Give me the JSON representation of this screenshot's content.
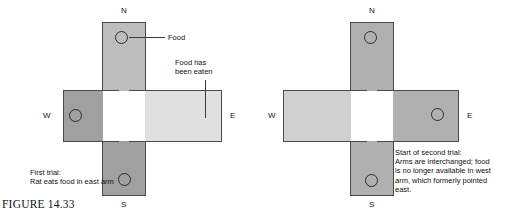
{
  "figure": {
    "caption": "FIGURE 14.33"
  },
  "colors": {
    "arm_medium_light": "#bdbdbd",
    "arm_dark": "#a0a0a0",
    "arm_very_light": "#e0e0e0",
    "arm_light": "#d0d0d0",
    "arm_medium": "#b0b0b0",
    "center_white": "#ffffff",
    "outline": "#4a4a4a",
    "text": "#111111"
  },
  "panels": [
    {
      "id": "first-trial",
      "compass": {
        "north": "N",
        "south": "S",
        "east": "E",
        "west": "W"
      },
      "arms": [
        {
          "direction": "north",
          "shade": "medium-light",
          "has_food": true
        },
        {
          "direction": "west",
          "shade": "dark",
          "has_food": true
        },
        {
          "direction": "east",
          "shade": "very-light",
          "has_food": false
        },
        {
          "direction": "south",
          "shade": "dark",
          "has_food": true
        }
      ],
      "labels": {
        "food": "Food",
        "food_eaten": "Food has\nbeen eaten"
      },
      "caption_lines": "First trial:\nRat eats food in east arm"
    },
    {
      "id": "second-trial",
      "compass": {
        "north": "N",
        "south": "S",
        "east": "E",
        "west": "W"
      },
      "arms": [
        {
          "direction": "north",
          "shade": "medium",
          "has_food": true
        },
        {
          "direction": "west",
          "shade": "light",
          "has_food": false
        },
        {
          "direction": "east",
          "shade": "medium",
          "has_food": true
        },
        {
          "direction": "south",
          "shade": "medium",
          "has_food": true
        }
      ],
      "caption_lines": "Start of second trial:\nArms are interchanged; food\nis no longer available in west\narm, which formerly pointed\neast."
    }
  ]
}
